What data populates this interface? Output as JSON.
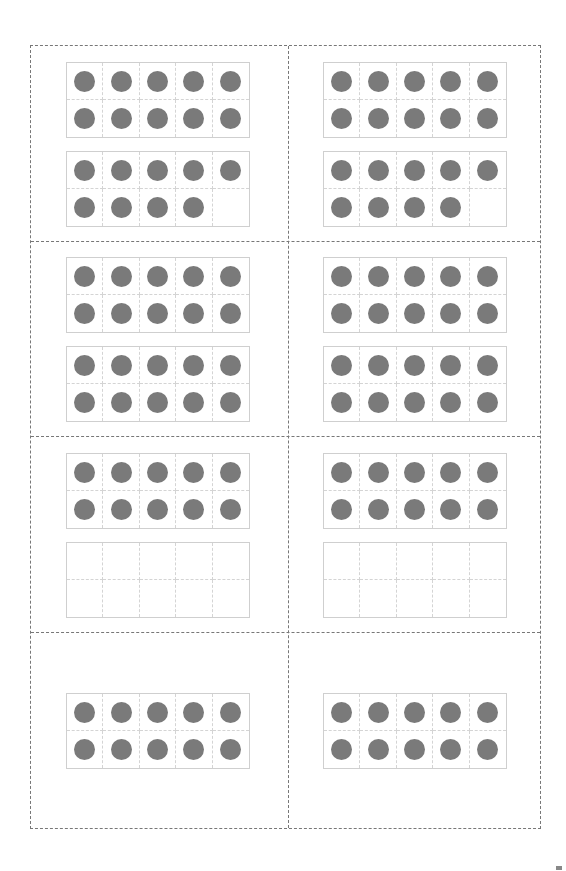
{
  "page": {
    "dot_color": "#7a7a7a",
    "frame_border_color": "#cfcfcf",
    "cut_line_color": "#777777"
  },
  "cards": [
    {
      "row": 0,
      "col": 0,
      "frames": [
        10,
        9
      ],
      "total": 19
    },
    {
      "row": 0,
      "col": 1,
      "frames": [
        10,
        9
      ],
      "total": 19
    },
    {
      "row": 1,
      "col": 0,
      "frames": [
        10,
        10
      ],
      "total": 20
    },
    {
      "row": 1,
      "col": 1,
      "frames": [
        10,
        10
      ],
      "total": 20
    },
    {
      "row": 2,
      "col": 0,
      "frames": [
        10,
        0
      ],
      "total": 10
    },
    {
      "row": 2,
      "col": 1,
      "frames": [
        10,
        0
      ],
      "total": 10
    },
    {
      "row": 3,
      "col": 0,
      "frames": [
        10
      ],
      "total": 10
    },
    {
      "row": 3,
      "col": 1,
      "frames": [
        10
      ],
      "total": 10
    }
  ]
}
